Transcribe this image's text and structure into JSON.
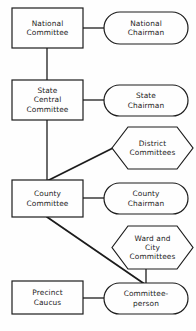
{
  "diagram": {
    "background_color": "#fefefe",
    "stroke_color": "#1c1c1c",
    "text_color": "#1c1c1c",
    "nodes": [
      {
        "id": "national-committee",
        "shape": "rectangle",
        "lines": [
          "National",
          "Committee"
        ],
        "x": 12,
        "y": 8,
        "w": 71,
        "h": 40
      },
      {
        "id": "national-chairman",
        "shape": "stadium",
        "lines": [
          "National",
          "Chairman"
        ],
        "x": 104,
        "y": 12,
        "w": 84,
        "h": 32
      },
      {
        "id": "state-central-committee",
        "shape": "rectangle",
        "lines": [
          "State",
          "Central",
          "Committee"
        ],
        "x": 12,
        "y": 80,
        "w": 71,
        "h": 40
      },
      {
        "id": "state-chairman",
        "shape": "stadium",
        "lines": [
          "State",
          "Chairman"
        ],
        "x": 104,
        "y": 85,
        "w": 84,
        "h": 31
      },
      {
        "id": "district-committees",
        "shape": "hexagon",
        "lines": [
          "District",
          "Committees"
        ],
        "x": 112,
        "y": 127,
        "w": 81,
        "h": 42
      },
      {
        "id": "county-committee",
        "shape": "rectangle",
        "lines": [
          "County",
          "Committee"
        ],
        "x": 12,
        "y": 180,
        "w": 71,
        "h": 37
      },
      {
        "id": "county-chairman",
        "shape": "stadium",
        "lines": [
          "County",
          "Chairman"
        ],
        "x": 104,
        "y": 183,
        "w": 84,
        "h": 31
      },
      {
        "id": "ward-and-city-committees",
        "shape": "hexagon",
        "lines": [
          "Ward and",
          "City",
          "Committees"
        ],
        "x": 112,
        "y": 226,
        "w": 81,
        "h": 43
      },
      {
        "id": "precinct-caucus",
        "shape": "rectangle",
        "lines": [
          "Precinct",
          "Caucus"
        ],
        "x": 12,
        "y": 281,
        "w": 71,
        "h": 33
      },
      {
        "id": "committee-person",
        "shape": "stadium",
        "lines": [
          "Committee-",
          "person"
        ],
        "x": 104,
        "y": 283,
        "w": 84,
        "h": 31
      }
    ],
    "connectors": [
      {
        "id": "national-committee-to-national-chairman",
        "kind": "horizontal",
        "from": "national-committee",
        "to": "national-chairman"
      },
      {
        "id": "national-committee-to-state-central-committee",
        "kind": "vertical",
        "from": "national-committee",
        "to": "state-central-committee"
      },
      {
        "id": "state-central-committee-to-state-chairman",
        "kind": "horizontal",
        "from": "state-central-committee",
        "to": "state-chairman"
      },
      {
        "id": "state-central-committee-to-county-committee",
        "kind": "vertical",
        "from": "state-central-committee",
        "to": "county-committee"
      },
      {
        "id": "county-committee-to-district-committees",
        "kind": "diagonal",
        "from": "county-committee",
        "to": "district-committees"
      },
      {
        "id": "county-committee-to-county-chairman",
        "kind": "horizontal",
        "from": "county-committee",
        "to": "county-chairman"
      },
      {
        "id": "county-committee-to-committee-person",
        "kind": "diagonal",
        "from": "county-committee",
        "to": "committee-person"
      },
      {
        "id": "ward-and-city-committees-to-committee-person",
        "kind": "vertical",
        "from": "ward-and-city-committees",
        "to": "committee-person"
      },
      {
        "id": "precinct-caucus-to-committee-person",
        "kind": "horizontal",
        "from": "precinct-caucus",
        "to": "committee-person"
      }
    ]
  }
}
